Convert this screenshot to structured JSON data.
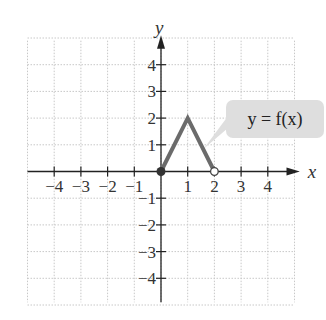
{
  "chart_data": {
    "type": "line",
    "title": "",
    "xlabel": "x",
    "ylabel": "y",
    "xlim": [
      -4,
      4
    ],
    "ylim": [
      -4,
      4
    ],
    "grid": true,
    "x_ticks": [
      "-4",
      "-3",
      "-2",
      "-1",
      "1",
      "2",
      "3",
      "4"
    ],
    "y_ticks": [
      "4",
      "3",
      "2",
      "1",
      "-1",
      "-2",
      "-3",
      "-4"
    ],
    "series": [
      {
        "name": "y = f(x)",
        "points": [
          [
            0,
            0
          ],
          [
            1,
            2
          ],
          [
            2,
            0
          ]
        ],
        "endpoints": {
          "start": {
            "x": 0,
            "y": 0,
            "style": "closed"
          },
          "end": {
            "x": 2,
            "y": 0,
            "style": "open"
          }
        },
        "color": "#6b6b6b"
      }
    ],
    "annotations": [
      {
        "text": "y = f(x)",
        "points_to": [
          1.5,
          1
        ]
      }
    ]
  },
  "labels": {
    "x_axis": "x",
    "y_axis": "y",
    "callout": "y = f(x)"
  }
}
